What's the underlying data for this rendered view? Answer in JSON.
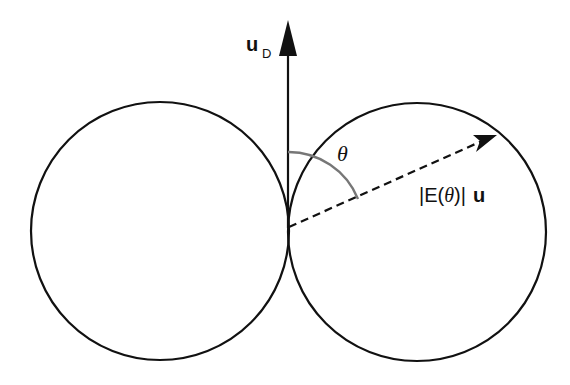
{
  "diagram": {
    "labels": {
      "dipole_vector": "u",
      "dipole_subscript": "D",
      "angle": "θ",
      "field_prefix": "|E(",
      "field_theta": "θ",
      "field_suffix": ")|",
      "field_unit_vector": "u"
    },
    "shapes": {
      "left_lobe": {
        "cx": 160,
        "cy": 231,
        "r": 129
      },
      "right_lobe": {
        "cx": 417,
        "cy": 232,
        "r": 129
      },
      "origin": {
        "x": 288,
        "y": 227
      },
      "dipole_arrow_tip": {
        "x": 288,
        "y": 20
      },
      "field_arrow_tip": {
        "x": 497,
        "y": 135
      },
      "angle_arc_radius": 75
    },
    "colors": {
      "stroke": "#111111",
      "arc": "#777777",
      "background": "#ffffff"
    }
  }
}
